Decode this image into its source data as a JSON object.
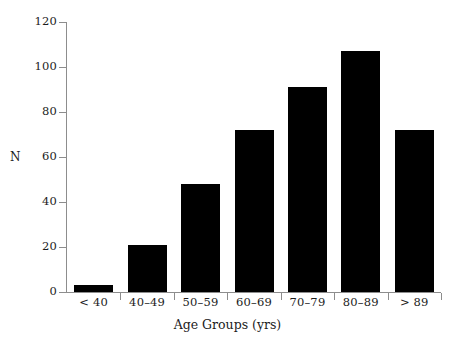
{
  "chart_data": {
    "type": "bar",
    "title": "",
    "subtitle": "",
    "categories": [
      "< 40",
      "40–49",
      "50–59",
      "60–69",
      "70–79",
      "80–89",
      "> 89"
    ],
    "values": [
      3,
      21,
      48,
      72,
      91,
      107,
      72
    ],
    "series": [
      {
        "name": "N",
        "values": [
          3,
          21,
          48,
          72,
          91,
          107,
          72
        ]
      }
    ],
    "xlabel": "Age Groups (yrs)",
    "ylabel": "N",
    "ylim": [
      0,
      120
    ],
    "yticks": [
      0,
      20,
      40,
      60,
      80,
      100,
      120
    ],
    "ytick_labels": [
      "0",
      "20",
      "40",
      "60",
      "80",
      "100",
      "120"
    ],
    "grid": false,
    "legend": false,
    "legend_position": "none",
    "bar_color": "#000000",
    "axis_color": "#8d8d8d",
    "background_color": "#ffffff",
    "annotations": []
  },
  "axis": {
    "y_title": "N",
    "x_title": "Age Groups (yrs)"
  }
}
